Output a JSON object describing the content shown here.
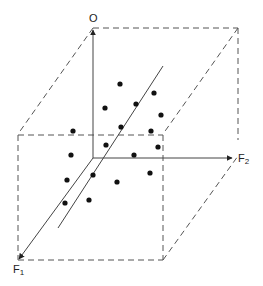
{
  "diagram": {
    "title": "",
    "axes": {
      "vertical": {
        "label": "O"
      },
      "horizontal": {
        "label": "F",
        "subscript": "2"
      },
      "depth": {
        "label": "F",
        "subscript": "1"
      }
    },
    "colors": {
      "line": "#444444",
      "dash": "#555555",
      "dot": "#111111"
    },
    "points": [
      [
        120,
        84
      ],
      [
        154,
        93
      ],
      [
        105,
        108
      ],
      [
        136,
        104
      ],
      [
        161,
        115
      ],
      [
        73,
        131
      ],
      [
        121,
        127
      ],
      [
        151,
        131
      ],
      [
        106,
        145
      ],
      [
        158,
        147
      ],
      [
        134,
        155
      ],
      [
        71,
        155
      ],
      [
        93,
        175
      ],
      [
        150,
        173
      ],
      [
        117,
        182
      ],
      [
        67,
        180
      ],
      [
        65,
        203
      ],
      [
        89,
        200
      ]
    ]
  }
}
